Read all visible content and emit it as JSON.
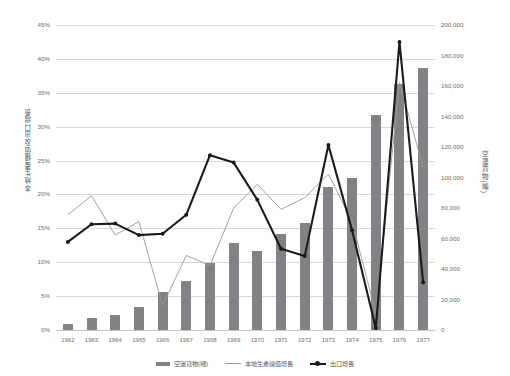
{
  "chart_data": {
    "type": "bar",
    "title": "",
    "subtitle": "",
    "xlabel": "",
    "ylabel": "本地生產總值及出口增長",
    "y2label": "空運貨物(噸)",
    "grid": true,
    "legend_position": "bottom",
    "categories": [
      "1962",
      "1963",
      "1964",
      "1965",
      "1966",
      "1967",
      "1968",
      "1969",
      "1970",
      "1971",
      "1972",
      "1973",
      "1974",
      "1975",
      "1976",
      "1977"
    ],
    "ylim": [
      0,
      45
    ],
    "yticks": [
      "0%",
      "5%",
      "10%",
      "15%",
      "20%",
      "25%",
      "30%",
      "35%",
      "40%",
      "45%"
    ],
    "ytick_values": [
      0,
      5,
      10,
      15,
      20,
      25,
      30,
      35,
      40,
      45
    ],
    "y2lim": [
      0,
      200000
    ],
    "y2ticks": [
      "0",
      "20,000",
      "40,000",
      "60,000",
      "80,000",
      "100,000",
      "120,000",
      "140,000",
      "160,000",
      "180,000",
      "200,000"
    ],
    "y2tick_values": [
      0,
      20000,
      40000,
      60000,
      80000,
      100000,
      120000,
      140000,
      160000,
      180000,
      200000
    ],
    "series": [
      {
        "name": "空運貨物(噸)",
        "type": "bar",
        "axis": "right",
        "color": "#808285",
        "values": [
          4000,
          8000,
          10000,
          15000,
          25000,
          32000,
          44000,
          57000,
          52000,
          63000,
          70000,
          94000,
          100000,
          141000,
          161000,
          172000
        ]
      },
      {
        "name": "本地生產總值增長",
        "type": "line",
        "axis": "left",
        "color": "#9a9a9a",
        "values": [
          17.0,
          19.8,
          14.0,
          16.0,
          3.6,
          11.0,
          9.5,
          18.0,
          21.5,
          17.8,
          19.5,
          23.0,
          16.0,
          2.5,
          36.5,
          24.0
        ]
      },
      {
        "name": "出口增長",
        "type": "line",
        "axis": "left",
        "color": "#1a1a1a",
        "markers": true,
        "values": [
          13.0,
          15.6,
          15.7,
          14.0,
          14.2,
          17.0,
          25.8,
          24.7,
          19.2,
          12.0,
          10.9,
          27.3,
          14.7,
          0.3,
          42.5,
          7.0
        ]
      }
    ]
  },
  "legend": {
    "items": [
      {
        "label": "空運貨物(噸)",
        "kind": "bar"
      },
      {
        "label": "本地生產總值增長",
        "kind": "line"
      },
      {
        "label": "出口增長",
        "kind": "marker-line"
      }
    ]
  }
}
